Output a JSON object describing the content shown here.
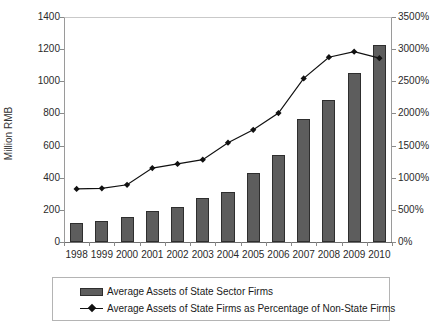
{
  "chart_data": {
    "type": "bar",
    "title": "",
    "subtitle": "",
    "xlabel": "",
    "ylabel": "Million RMB",
    "ylabel_secondary": "",
    "categories": [
      "1998",
      "1999",
      "2000",
      "2001",
      "2002",
      "2003",
      "2004",
      "2005",
      "2006",
      "2007",
      "2008",
      "2009",
      "2010"
    ],
    "ylim": [
      0,
      1400
    ],
    "ylim_secondary": [
      0,
      3500
    ],
    "ytick_labels": [
      "0",
      "200",
      "400",
      "600",
      "800",
      "1000",
      "1200",
      "1400"
    ],
    "ytick_values": [
      0,
      200,
      400,
      600,
      800,
      1000,
      1200,
      1400
    ],
    "ytick_labels_secondary": [
      "0%",
      "500%",
      "1000%",
      "1500%",
      "2000%",
      "2500%",
      "3000%",
      "3500%"
    ],
    "ytick_values_secondary": [
      0,
      500,
      1000,
      1500,
      2000,
      2500,
      3000,
      3500
    ],
    "grid": false,
    "legend_position": "bottom",
    "series": [
      {
        "name": "Average Assets of State Sector Firms",
        "type": "bar",
        "axis": "left",
        "unit": "Million RMB",
        "color": "#5d5d5d",
        "values": [
          118,
          133,
          158,
          190,
          217,
          275,
          310,
          428,
          540,
          765,
          885,
          1050,
          1225
        ]
      },
      {
        "name": "Average Assets of State Firms as Percentage of Non-State Firms",
        "type": "line",
        "axis": "right",
        "unit": "%",
        "color": "#111111",
        "marker": "diamond",
        "values": [
          825,
          835,
          890,
          1150,
          1215,
          1280,
          1545,
          1745,
          2005,
          2545,
          2875,
          2960,
          2860
        ]
      }
    ]
  },
  "legend": {
    "items": [
      {
        "label": "Average Assets of State Sector Firms",
        "marker": "bar-swatch-icon"
      },
      {
        "label": "Average Assets of State Firms as Percentage of Non-State Firms",
        "marker": "line-diamond-icon"
      }
    ]
  }
}
